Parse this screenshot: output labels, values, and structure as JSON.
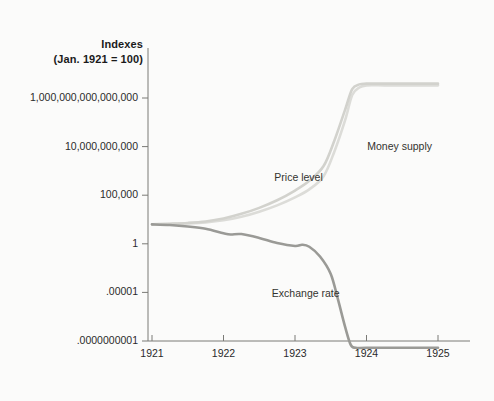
{
  "chart_data": {
    "type": "line",
    "title": "Indexes",
    "subtitle": "(Jan. 1921 = 100)",
    "xlabel": "",
    "ylabel": "Indexes (Jan. 1921 = 100)",
    "yscale": "log",
    "ylim": [
      1e-10,
      1e+16
    ],
    "xlim": [
      1921.0,
      1925.0
    ],
    "grid": false,
    "legend_position": "inline-annotations",
    "ytick_labels": [
      "1,000,000,000,000,000",
      "10,000,000,000",
      "100,000",
      "1",
      ".00001",
      ".0000000001"
    ],
    "ytick_values": [
      1000000000000000.0,
      10000000000.0,
      100000.0,
      1,
      1e-05,
      1e-10
    ],
    "xtick_labels": [
      "1921",
      "1922",
      "1923",
      "1924",
      "1925"
    ],
    "xtick_values": [
      1921,
      1922,
      1923,
      1924,
      1925
    ],
    "series": [
      {
        "name": "Money supply",
        "color": "#dcdcd8",
        "label_x": 1925.0,
        "label_y": 100000000000.0,
        "points": [
          [
            1921.0,
            100
          ],
          [
            1921.25,
            110
          ],
          [
            1921.5,
            125
          ],
          [
            1921.75,
            160
          ],
          [
            1922.0,
            260
          ],
          [
            1922.25,
            600
          ],
          [
            1922.5,
            2000
          ],
          [
            1922.75,
            9000
          ],
          [
            1923.0,
            60000
          ],
          [
            1923.2,
            400000
          ],
          [
            1923.4,
            9000000
          ],
          [
            1923.55,
            3000000000
          ],
          [
            1923.7,
            5000000000000
          ],
          [
            1923.8,
            2000000000000000
          ],
          [
            1923.9,
            1.2e+16
          ],
          [
            1924.0,
            2e+16
          ],
          [
            1924.25,
            2e+16
          ],
          [
            1924.5,
            2e+16
          ],
          [
            1925.0,
            2e+16
          ]
        ]
      },
      {
        "name": "Price level",
        "color": "#d2d2cd",
        "label_x": 1923.05,
        "label_y": 3500000.0,
        "points": [
          [
            1921.0,
            100
          ],
          [
            1921.25,
            115
          ],
          [
            1921.5,
            140
          ],
          [
            1921.75,
            200
          ],
          [
            1922.0,
            400
          ],
          [
            1922.25,
            1200
          ],
          [
            1922.5,
            5000
          ],
          [
            1922.75,
            30000
          ],
          [
            1923.0,
            300000
          ],
          [
            1923.2,
            3000000
          ],
          [
            1923.4,
            100000000.0
          ],
          [
            1923.55,
            40000000000.0
          ],
          [
            1923.7,
            60000000000000.0
          ],
          [
            1923.8,
            8000000000000000.0
          ],
          [
            1923.9,
            2.5e+16
          ],
          [
            1924.0,
            3e+16
          ],
          [
            1924.25,
            3e+16
          ],
          [
            1924.5,
            3e+16
          ],
          [
            1925.0,
            3e+16
          ]
        ]
      },
      {
        "name": "Exchange rate",
        "color": "#9a9a96",
        "label_x": 1923.15,
        "label_y": 1.2e-05,
        "points": [
          [
            1921.0,
            100
          ],
          [
            1921.25,
            85
          ],
          [
            1921.5,
            60
          ],
          [
            1921.75,
            35
          ],
          [
            1922.0,
            12
          ],
          [
            1922.1,
            9
          ],
          [
            1922.25,
            10
          ],
          [
            1922.5,
            4
          ],
          [
            1922.75,
            1.2
          ],
          [
            1923.0,
            0.6
          ],
          [
            1923.1,
            0.8
          ],
          [
            1923.2,
            0.5
          ],
          [
            1923.35,
            0.05
          ],
          [
            1923.5,
            0.0008
          ],
          [
            1923.6,
            2e-06
          ],
          [
            1923.7,
            3e-09
          ],
          [
            1923.78,
            4e-11
          ],
          [
            1923.85,
            2e-11
          ],
          [
            1924.0,
            2e-11
          ],
          [
            1924.5,
            2e-11
          ],
          [
            1925.0,
            2e-11
          ]
        ]
      }
    ]
  },
  "axis": {
    "tick_color": "#7a7a76",
    "line_color": "#7a7a76"
  }
}
